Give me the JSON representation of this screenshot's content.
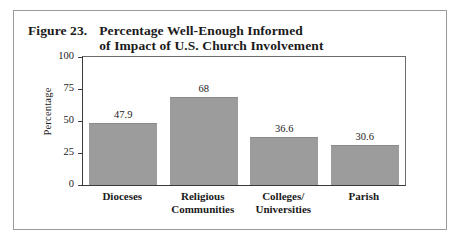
{
  "figure": {
    "number": "Figure 23.",
    "title_line1": "Percentage Well-Enough Informed",
    "title_line2": "of Impact of U.S. Church Involvement"
  },
  "chart_data": {
    "type": "bar",
    "title": "Figure 23. Percentage Well-Enough Informed of Impact of U.S. Church Involvement",
    "categories": [
      "Dioceses",
      "Religious\nCommunities",
      "Colleges/\nUniversities",
      "Parish"
    ],
    "values": [
      47.9,
      68,
      36.6,
      30.6
    ],
    "value_labels": [
      "47.9",
      "68",
      "36.6",
      "30.6"
    ],
    "xlabel": "",
    "ylabel": "Percentage",
    "ylim": [
      0,
      100
    ],
    "yticks": [
      0,
      25,
      50,
      75,
      100
    ],
    "ytick_labels": [
      "0",
      "25",
      "50",
      "75",
      "100"
    ],
    "grid": false,
    "legend": false,
    "bar_color": "#9c9c9c"
  }
}
